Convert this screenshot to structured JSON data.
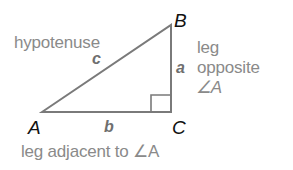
{
  "diagram": {
    "vertices": {
      "A": {
        "label": "A",
        "x": 42,
        "y": 112
      },
      "B": {
        "label": "B",
        "x": 171,
        "y": 25
      },
      "C": {
        "label": "C",
        "x": 171,
        "y": 112
      }
    },
    "sides": {
      "a": "a",
      "b": "b",
      "c": "c"
    },
    "annotations": {
      "hypotenuse": "hypotenuse",
      "leg_opposite_line1": "leg",
      "leg_opposite_line2": "opposite",
      "leg_opposite_line3": "∠A",
      "leg_adjacent": "leg adjacent to ∠A"
    },
    "right_angle_marker_at": "C",
    "colors": {
      "triangle_stroke": "#7a7a7a",
      "annotation_text": "#8a8a8a",
      "vertex_label": "#111111",
      "side_label": "#6f6f6f",
      "background": "#ffffff"
    }
  }
}
